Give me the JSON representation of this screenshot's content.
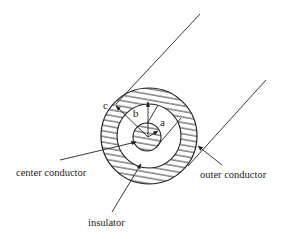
{
  "diagram": {
    "colors": {
      "stroke": "#222222",
      "background": "#ffffff"
    },
    "geometry": {
      "center": [
        148,
        136
      ],
      "outer_radius": 48,
      "outer_inner_radius": 32,
      "center_conductor_radius": 14
    },
    "radius_labels": {
      "a": "a",
      "b": "b",
      "c": "c"
    },
    "callouts": {
      "center_conductor": "center conductor",
      "outer_conductor": "outer conductor",
      "insulator": "insulator"
    }
  }
}
